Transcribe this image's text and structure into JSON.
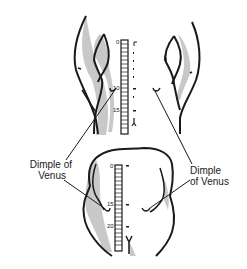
{
  "figure": {
    "upper_view": {
      "description": "Lower back, standing flexed view",
      "ruler": {
        "tick_labels": [
          "0",
          "10",
          "15"
        ]
      }
    },
    "lower_view": {
      "description": "Lower back, upright view",
      "ruler": {
        "tick_labels": [
          "0",
          "15",
          "20"
        ]
      }
    },
    "labels": {
      "left": {
        "line1": "Dimple of",
        "line2": "Venus"
      },
      "right": {
        "line1": "Dimple",
        "line2": "of Venus"
      }
    },
    "colors": {
      "ink": "#1a1a1a",
      "shading": "#c8c8c8"
    }
  }
}
